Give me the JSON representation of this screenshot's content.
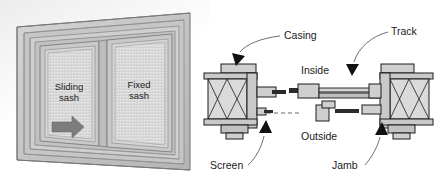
{
  "figure": {
    "background_color": "#ffffff"
  },
  "left_panel": {
    "name": "sliding-window-perspective",
    "description": "Perspective drawing of a horizontal sliding window with two sashes",
    "frame_color": "#c8c8c8",
    "frame_edge_color": "#8a8a8a",
    "glass_color": "#dcdcdc",
    "labels": {
      "sliding_sash_line1": "Sliding",
      "sliding_sash_line2": "sash",
      "fixed_sash_line1": "Fixed",
      "fixed_sash_line2": "sash"
    },
    "direction_arrow": {
      "name": "slide-direction-arrow",
      "direction": "right",
      "color": "#7d7d7d"
    }
  },
  "right_panel": {
    "name": "window-plan-section",
    "description": "Horizontal plan section through a sliding window showing jambs, sashes and track",
    "callouts": [
      {
        "id": "casing",
        "label": "Casing"
      },
      {
        "id": "track",
        "label": "Track"
      },
      {
        "id": "screen",
        "label": "Screen"
      },
      {
        "id": "jamb",
        "label": "Jamb"
      }
    ],
    "orientation_labels": [
      {
        "id": "inside",
        "label": "Inside"
      },
      {
        "id": "outside",
        "label": "Outside"
      }
    ],
    "colors": {
      "section_fill": "#c9c9c9",
      "section_fill_light": "#dadada",
      "section_fill_dark": "#9a9a9a",
      "outline": "#1c1c1c",
      "glass_dark": "#2b2b2b",
      "leader_line": "#4a4a4a",
      "arrowhead": "#111111"
    }
  }
}
